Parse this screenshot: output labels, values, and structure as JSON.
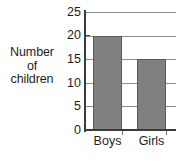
{
  "chart_data": {
    "type": "bar",
    "title": "",
    "subtitle": "",
    "xlabel": "",
    "ylabel": "Number of children",
    "ylabel_lines": [
      "Number",
      "of",
      "children"
    ],
    "categories": [
      "Boys",
      "Girls"
    ],
    "values": [
      20,
      15
    ],
    "series": [
      {
        "name": "Number of children",
        "values": [
          20,
          15
        ]
      }
    ],
    "ylim": [
      0,
      25
    ],
    "y_ticks": [
      0,
      5,
      10,
      15,
      20,
      25
    ],
    "y_tick_labels": [
      "0",
      "5",
      "10",
      "15",
      "20",
      "25"
    ],
    "grid": true,
    "grid_axis": "y",
    "legend": false,
    "legend_position": "none",
    "annotations": [],
    "colors": {
      "bar_fill": "#808080",
      "bar_stroke": "#5a5a5a",
      "gridline": "#8c8c8c",
      "axis": "#3b3b3b",
      "text": "#1d1d1d",
      "background": "#ffffff"
    }
  }
}
